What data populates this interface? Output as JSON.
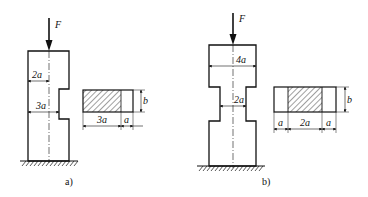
{
  "figures": [
    {
      "id": "a",
      "caption": "a)",
      "force_label": "F",
      "dimensions": {
        "half_width_label": "2a",
        "notched_width_label": "3a"
      },
      "cross_section": {
        "hatched_width_label": "3a",
        "open_width_label": "a",
        "height_label": "b"
      }
    },
    {
      "id": "b",
      "caption": "b)",
      "force_label": "F",
      "dimensions": {
        "full_width_label": "4a",
        "neck_width_label": "2a"
      },
      "cross_section": {
        "left_open_label": "a",
        "hatched_width_label": "2a",
        "right_open_label": "a",
        "height_label": "b"
      }
    }
  ],
  "colors": {
    "stroke": "#111111",
    "background": "#ffffff"
  }
}
